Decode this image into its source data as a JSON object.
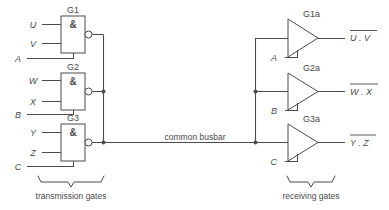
{
  "diagram": {
    "bus_label": "common busbar",
    "captions": {
      "left": "transmission gates",
      "right": "receiving gates"
    },
    "transmission_gates": [
      {
        "id": "G1",
        "name": "G1",
        "symbol": "&",
        "type": "nand",
        "inputs": [
          "U",
          "V"
        ],
        "enable": "A"
      },
      {
        "id": "G2",
        "name": "G2",
        "symbol": "&",
        "type": "nand",
        "inputs": [
          "W",
          "X"
        ],
        "enable": "B"
      },
      {
        "id": "G3",
        "name": "G3",
        "symbol": "&",
        "type": "nand",
        "inputs": [
          "Y",
          "Z"
        ],
        "enable": "C"
      }
    ],
    "receiving_gates": [
      {
        "id": "G1a",
        "name": "G1a",
        "type": "buffer",
        "enable": "A",
        "output": "U . V",
        "output_overbar": true
      },
      {
        "id": "G2a",
        "name": "G2a",
        "type": "buffer",
        "enable": "B",
        "output": "W . X",
        "output_overbar": true
      },
      {
        "id": "G3a",
        "name": "G3a",
        "type": "buffer",
        "enable": "C",
        "output": "Y . Z",
        "output_overbar": true
      }
    ],
    "colors": {
      "line": "#4a4a4a",
      "background": "#ffffff"
    }
  }
}
